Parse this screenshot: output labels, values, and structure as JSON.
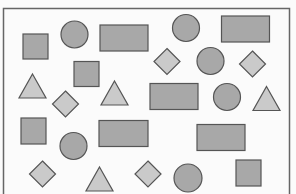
{
  "figure": {
    "colors": {
      "background": "#fbfbfb",
      "frame": "#666666",
      "shape_stroke": "#555555",
      "dark_fill": "#a8a8a8",
      "light_fill": "#cacaca"
    },
    "shape_counts": {
      "square": 5,
      "circle": 6,
      "rectangle": 5,
      "diamond": 5,
      "triangle": 4
    },
    "shapes": [
      {
        "type": "square",
        "row": 1,
        "order": 1
      },
      {
        "type": "circle",
        "row": 1,
        "order": 2
      },
      {
        "type": "rectangle",
        "row": 1,
        "order": 3
      },
      {
        "type": "circle",
        "row": 1,
        "order": 4
      },
      {
        "type": "rectangle",
        "row": 1,
        "order": 5
      },
      {
        "type": "square",
        "row": 2,
        "order": 1
      },
      {
        "type": "diamond",
        "row": 2,
        "order": 2
      },
      {
        "type": "circle",
        "row": 2,
        "order": 3
      },
      {
        "type": "diamond",
        "row": 2,
        "order": 4
      },
      {
        "type": "triangle",
        "row": 3,
        "order": 1
      },
      {
        "type": "diamond",
        "row": 3,
        "order": 2
      },
      {
        "type": "triangle",
        "row": 3,
        "order": 3
      },
      {
        "type": "rectangle",
        "row": 3,
        "order": 4
      },
      {
        "type": "circle",
        "row": 3,
        "order": 5
      },
      {
        "type": "triangle",
        "row": 3,
        "order": 6
      },
      {
        "type": "square",
        "row": 4,
        "order": 1
      },
      {
        "type": "circle",
        "row": 4,
        "order": 2
      },
      {
        "type": "rectangle",
        "row": 4,
        "order": 3
      },
      {
        "type": "rectangle",
        "row": 4,
        "order": 4
      },
      {
        "type": "diamond",
        "row": 5,
        "order": 1
      },
      {
        "type": "triangle",
        "row": 5,
        "order": 2
      },
      {
        "type": "diamond",
        "row": 5,
        "order": 3
      },
      {
        "type": "circle",
        "row": 5,
        "order": 4
      },
      {
        "type": "square",
        "row": 5,
        "order": 5
      }
    ]
  }
}
